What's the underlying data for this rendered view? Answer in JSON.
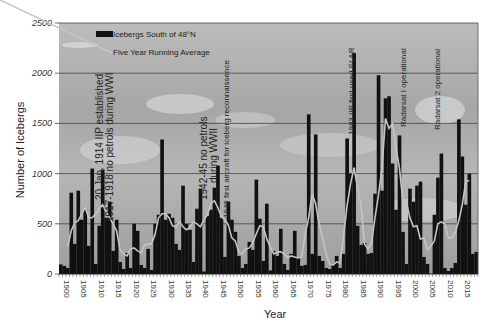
{
  "chart_data": {
    "type": "bar",
    "title": "",
    "xlabel": "Year",
    "ylabel": "Number of Icebergs",
    "ylim": [
      0,
      2500
    ],
    "yticks": [
      0,
      500,
      1000,
      1500,
      2000,
      2500
    ],
    "xticks": [
      1900,
      1905,
      1910,
      1915,
      1920,
      1925,
      1930,
      1935,
      1940,
      1945,
      1950,
      1955,
      1960,
      1965,
      1970,
      1975,
      1980,
      1985,
      1990,
      1995,
      2000,
      2005,
      2010,
      2015
    ],
    "grid": true,
    "legend_position": "upper-left",
    "legend": [
      "Icebergs South of 48°N",
      "Five Year Running Average"
    ],
    "x": [
      1900,
      1901,
      1902,
      1903,
      1904,
      1905,
      1906,
      1907,
      1908,
      1909,
      1910,
      1911,
      1912,
      1913,
      1914,
      1915,
      1916,
      1917,
      1918,
      1919,
      1920,
      1921,
      1922,
      1923,
      1924,
      1925,
      1926,
      1927,
      1928,
      1929,
      1930,
      1931,
      1932,
      1933,
      1934,
      1935,
      1936,
      1937,
      1938,
      1939,
      1940,
      1941,
      1942,
      1943,
      1944,
      1945,
      1946,
      1947,
      1948,
      1949,
      1950,
      1951,
      1952,
      1953,
      1954,
      1955,
      1956,
      1957,
      1958,
      1959,
      1960,
      1961,
      1962,
      1963,
      1964,
      1965,
      1966,
      1967,
      1968,
      1969,
      1970,
      1971,
      1972,
      1973,
      1974,
      1975,
      1976,
      1977,
      1978,
      1979,
      1980,
      1981,
      1982,
      1983,
      1984,
      1985,
      1986,
      1987,
      1988,
      1989,
      1990,
      1991,
      1992,
      1993,
      1994,
      1995,
      1996,
      1997,
      1998,
      1999,
      2000,
      2001,
      2002,
      2003,
      2004,
      2005,
      2006,
      2007,
      2008,
      2009,
      2010,
      2011,
      2012,
      2013,
      2014,
      2015,
      2016,
      2017,
      2018,
      2019
    ],
    "series": [
      {
        "name": "Icebergs South of 48°N",
        "values": [
          95,
          80,
          60,
          810,
          300,
          830,
          540,
          640,
          280,
          1050,
          100,
          480,
          1040,
          560,
          720,
          230,
          540,
          120,
          50,
          210,
          60,
          500,
          430,
          90,
          60,
          250,
          40,
          500,
          590,
          1340,
          540,
          600,
          560,
          300,
          240,
          880,
          500,
          440,
          120,
          650,
          850,
          25,
          580,
          640,
          860,
          1080,
          560,
          170,
          720,
          540,
          420,
          180,
          60,
          100,
          320,
          240,
          940,
          550,
          130,
          700,
          35,
          230,
          180,
          450,
          100,
          40,
          200,
          430,
          160,
          80,
          90,
          1590,
          200,
          1390,
          180,
          130,
          60,
          50,
          100,
          180,
          60,
          200,
          1350,
          1000,
          2200,
          480,
          290,
          310,
          200,
          210,
          800,
          1980,
          830,
          1750,
          1770,
          1100,
          640,
          1380,
          420,
          100,
          850,
          720,
          880,
          920,
          170,
          100,
          0,
          590,
          960,
          1200,
          60,
          30,
          60,
          110,
          1540,
          1170,
          690,
          1000,
          200,
          220
        ],
        "color": "#111111"
      },
      {
        "name": "Five Year Running Average",
        "values": [
          null,
          null,
          270,
          430,
          510,
          530,
          600,
          660,
          560,
          560,
          600,
          650,
          690,
          620,
          560,
          500,
          430,
          240,
          200,
          180,
          250,
          260,
          230,
          210,
          290,
          300,
          300,
          390,
          560,
          600,
          600,
          560,
          480,
          470,
          520,
          470,
          440,
          460,
          520,
          500,
          470,
          540,
          590,
          700,
          730,
          660,
          570,
          540,
          490,
          360,
          330,
          220,
          200,
          250,
          260,
          310,
          400,
          480,
          470,
          350,
          270,
          200,
          220,
          220,
          200,
          160,
          180,
          170,
          160,
          170,
          400,
          560,
          800,
          700,
          500,
          360,
          200,
          100,
          90,
          120,
          110,
          380,
          680,
          900,
          1060,
          860,
          690,
          300,
          250,
          310,
          560,
          790,
          1060,
          1550,
          1450,
          1500,
          1260,
          1060,
          720,
          720,
          560,
          470,
          480,
          350,
          360,
          240,
          280,
          330,
          500,
          520,
          500,
          360,
          360,
          410,
          530,
          690,
          920,
          930,
          null,
          null
        ],
        "color": "#bdbdbd"
      }
    ],
    "annotations": [
      {
        "text": "20 Jan. 1914 IIP established",
        "year": 1914
      },
      {
        "text": "1917-1918 no petrols during WWI",
        "year": 1918
      },
      {
        "text": "1942-45 no petrols",
        "year": 1944
      },
      {
        "text": "during WWII",
        "year": 1945
      },
      {
        "text": "1946 first aircraft for iceberg reconnaissence",
        "year": 1947
      },
      {
        "text": "1983 IIP first used SLAR",
        "year": 1983
      },
      {
        "text": "Radarsat I operational",
        "year": 1995
      },
      {
        "text": "Radarsat 2 operational",
        "year": 2008
      }
    ]
  },
  "colors": {
    "bar": "#111111",
    "running_avg": "#bdbdbd",
    "plot_bg": "#a9a9a9",
    "gridline": "#444444"
  }
}
